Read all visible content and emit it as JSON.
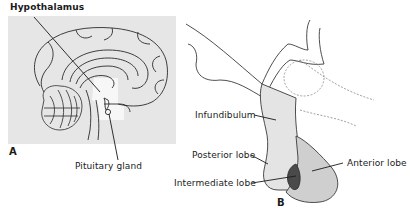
{
  "panel_a": {
    "letter": "A",
    "labels": {
      "hypothalamus": "Hypothalamus",
      "pituitary_gland": "Pituitary gland"
    },
    "colors": {
      "panel_bg": "#e6e6e6",
      "highlight": "#f7f7f7",
      "line": "#2a2a2a"
    }
  },
  "panel_b": {
    "letter": "B",
    "labels": {
      "infundibulum": "Infundibulum",
      "posterior_lobe": "Posterior lobe",
      "intermediate_lobe": "Intermediate lobe",
      "anterior_lobe": "Anterior lobe"
    },
    "colors": {
      "posterior_fill": "#e4e4e4",
      "anterior_fill": "#cfcfcf",
      "intermediate_fill": "#4a4a4a",
      "line": "#3a3a3a",
      "dashed": "#8a8a8a"
    }
  }
}
